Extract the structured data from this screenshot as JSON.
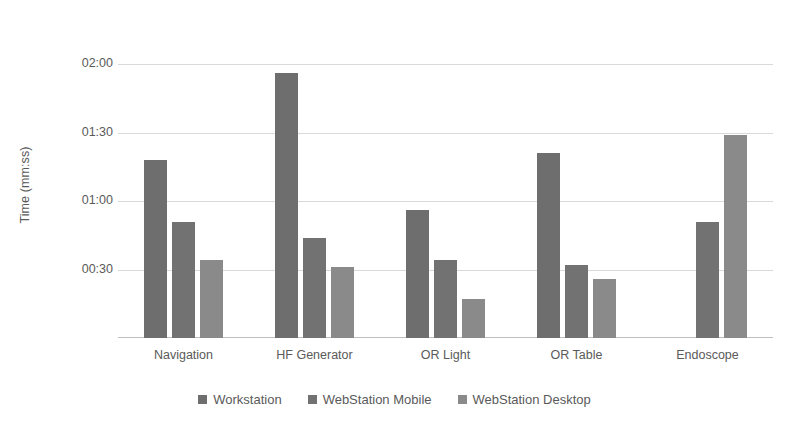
{
  "chart_data": {
    "type": "bar",
    "title": "",
    "xlabel": "",
    "ylabel": "Time (mm:ss)",
    "categories": [
      "Navigation",
      "HF Generator",
      "OR Light",
      "OR Table",
      "Endoscope"
    ],
    "series": [
      {
        "name": "Workstation",
        "color": "#6e6e6e",
        "values": [
          78,
          116,
          56,
          81,
          null
        ],
        "value_labels": [
          "01:18",
          "01:56",
          "00:56",
          "01:21",
          ""
        ]
      },
      {
        "name": "WebStation Mobile",
        "color": "#727272",
        "values": [
          51,
          44,
          34,
          32,
          51
        ],
        "value_labels": [
          "00:51",
          "00:44",
          "00:34",
          "00:32",
          "00:51"
        ]
      },
      {
        "name": "WebStation Desktop",
        "color": "#8a8a8a",
        "values": [
          34,
          31,
          17,
          26,
          89
        ],
        "value_labels": [
          "00:34",
          "00:31",
          "00:17",
          "00:26",
          "01:29"
        ]
      }
    ],
    "ylim": [
      0,
      135
    ],
    "yticks": [
      0,
      30,
      60,
      90,
      120
    ],
    "ytick_labels": [
      "",
      "00:30",
      "01:00",
      "01:30",
      "02:00"
    ],
    "y_unit": "seconds",
    "grid": true,
    "legend_position": "bottom"
  },
  "axis": {
    "ticks": [
      {
        "label": "02:00",
        "value": 120
      },
      {
        "label": "01:30",
        "value": 90
      },
      {
        "label": "01:00",
        "value": 60
      },
      {
        "label": "00:30",
        "value": 30
      }
    ]
  },
  "colors": {
    "gridline": "#d9d9d9",
    "axis": "#bfbfbf",
    "text": "#5a5a5a",
    "background": "#ffffff"
  }
}
